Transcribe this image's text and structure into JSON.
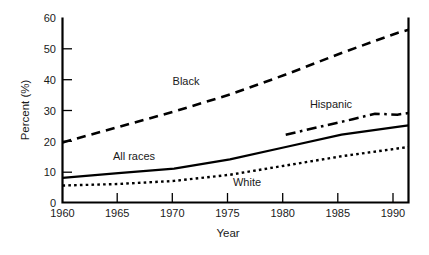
{
  "chart_data": {
    "type": "line",
    "title": "",
    "xlabel": "Year",
    "ylabel": "Percent (%)",
    "xlim": [
      1960,
      1991
    ],
    "ylim": [
      0,
      60
    ],
    "xticks": [
      1960,
      1965,
      1970,
      1975,
      1980,
      1985,
      1990
    ],
    "yticks": [
      0,
      10,
      20,
      30,
      40,
      50,
      60
    ],
    "xtick_labels": [
      "1960",
      "1965",
      "1970",
      "1975",
      "1980",
      "1985",
      "1990"
    ],
    "ytick_labels": [
      "0",
      "10",
      "20",
      "30",
      "40",
      "50",
      "60"
    ],
    "grid": false,
    "legend": "inline-annotations",
    "series": [
      {
        "name": "Black",
        "style": "dashed",
        "label": "Black",
        "label_x": 1971.5,
        "label_y": 36.5,
        "x": [
          1960,
          1965,
          1970,
          1975,
          1980,
          1985,
          1990,
          1991
        ],
        "values": [
          19.5,
          24.5,
          29.5,
          35.0,
          41.5,
          48.5,
          55.0,
          56.0
        ]
      },
      {
        "name": "Hispanic",
        "style": "dash-dot",
        "label": "Hispanic",
        "label_x": 1983.5,
        "label_y": 31.5,
        "x": [
          1980,
          1983,
          1986,
          1988,
          1990,
          1991
        ],
        "values": [
          22.0,
          24.5,
          27.0,
          28.8,
          28.5,
          29.0
        ]
      },
      {
        "name": "All races",
        "style": "solid",
        "label": "All races",
        "label_x": 1970.5,
        "label_y": 15.0,
        "x": [
          1960,
          1965,
          1970,
          1975,
          1980,
          1985,
          1990,
          1991
        ],
        "values": [
          8.0,
          9.5,
          11.0,
          14.0,
          18.0,
          22.0,
          24.5,
          25.0
        ]
      },
      {
        "name": "White",
        "style": "dotted",
        "label": "White",
        "label_x": 1978.0,
        "label_y": 8.0,
        "x": [
          1960,
          1965,
          1970,
          1975,
          1980,
          1985,
          1990,
          1991
        ],
        "values": [
          5.5,
          6.0,
          7.0,
          9.0,
          12.0,
          15.0,
          17.5,
          18.0
        ]
      }
    ]
  },
  "axis": {
    "y_title": "Percent (%)",
    "x_title": "Year"
  },
  "ticks": {
    "y": [
      {
        "label": "60"
      },
      {
        "label": "50"
      },
      {
        "label": "40"
      },
      {
        "label": "30"
      },
      {
        "label": "20"
      },
      {
        "label": "10"
      },
      {
        "label": "0"
      }
    ],
    "x": [
      {
        "label": "1960"
      },
      {
        "label": "1965"
      },
      {
        "label": "1970"
      },
      {
        "label": "1975"
      },
      {
        "label": "1980"
      },
      {
        "label": "1985"
      },
      {
        "label": "1990"
      }
    ]
  },
  "annotations": {
    "black": "Black",
    "hispanic": "Hispanic",
    "all_races": "All races",
    "white": "White"
  },
  "colors": {
    "background": "#ffffff",
    "ink": "#000000",
    "text": "#1a1a1a"
  }
}
